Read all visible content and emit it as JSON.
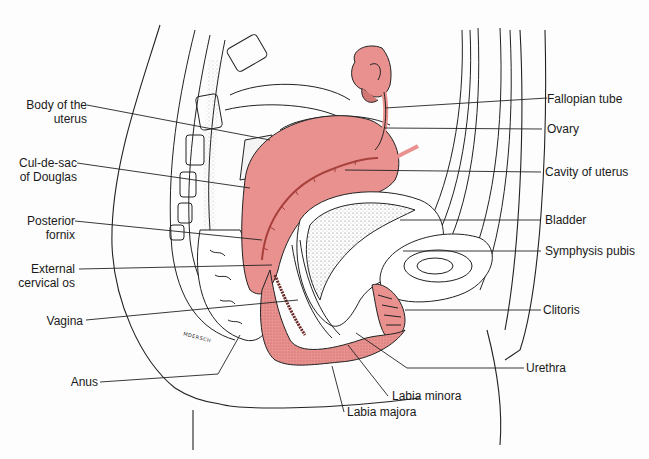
{
  "figure": {
    "signature": "MDERSCH",
    "colors": {
      "tissue_pink": "#e8918e",
      "tissue_pink_dark": "#a8403c",
      "line": "#222222",
      "background": "#fdfdfd"
    }
  },
  "labels": {
    "left": [
      {
        "id": "body-of-uterus",
        "text": "Body of the\nuterus"
      },
      {
        "id": "cul-de-sac",
        "text": "Cul-de-sac\nof Douglas"
      },
      {
        "id": "posterior-fornix",
        "text": "Posterior\nfornix"
      },
      {
        "id": "external-os",
        "text": "External\ncervical os"
      },
      {
        "id": "vagina",
        "text": "Vagina"
      },
      {
        "id": "anus",
        "text": "Anus"
      }
    ],
    "right": [
      {
        "id": "fallopian-tube",
        "text": "Fallopian tube"
      },
      {
        "id": "ovary",
        "text": "Ovary"
      },
      {
        "id": "cavity-of-uterus",
        "text": "Cavity of uterus"
      },
      {
        "id": "bladder",
        "text": "Bladder"
      },
      {
        "id": "symphysis-pubis",
        "text": "Symphysis pubis"
      },
      {
        "id": "clitoris",
        "text": "Clitoris"
      },
      {
        "id": "urethra",
        "text": "Urethra"
      }
    ],
    "bottom": [
      {
        "id": "labia-minora",
        "text": "Labia minora"
      },
      {
        "id": "labia-majora",
        "text": "Labia majora"
      }
    ]
  }
}
